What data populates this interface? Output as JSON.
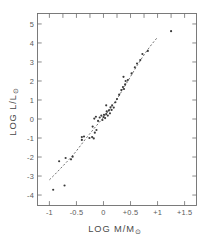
{
  "chart_data": {
    "type": "scatter",
    "title": "",
    "subtitle": "",
    "xlabel": "LOG  M/M",
    "xlabel_sub": "⊙",
    "ylabel": "LOG  L/L",
    "ylabel_sub": "⊙",
    "xlim": [
      -1.22,
      1.72
    ],
    "ylim": [
      -4.55,
      5.55
    ],
    "grid": false,
    "legend": null,
    "xticks": [
      -1,
      -0.5,
      0,
      0.5,
      1,
      1.5
    ],
    "xticklabels": [
      "-1",
      "-0.5",
      "0",
      "+0.5",
      "+1",
      "+1.5"
    ],
    "yticks": [
      -4,
      -3,
      -2,
      -1,
      0,
      1,
      2,
      3,
      4,
      5
    ],
    "yticklabels": [
      "-4",
      "-3",
      "-2",
      "-1",
      "0",
      "1",
      "2",
      "3",
      "4",
      "5"
    ],
    "xminor": [
      -1.25,
      -0.75,
      -0.25,
      0.25,
      0.75,
      1.25,
      1.75
    ],
    "frame": "box-all-sides-inward-ticks",
    "series": [
      {
        "name": "stars",
        "marker": "dot",
        "color": "#3a3a3a",
        "points": [
          [
            -0.93,
            -3.72
          ],
          [
            -0.72,
            -3.5
          ],
          [
            -0.82,
            -2.22
          ],
          [
            -0.7,
            -2.05
          ],
          [
            -0.6,
            -2.12
          ],
          [
            -0.57,
            -1.98
          ],
          [
            -0.4,
            -0.95
          ],
          [
            -0.4,
            -1.1
          ],
          [
            -0.36,
            -0.92
          ],
          [
            -0.26,
            -1.0
          ],
          [
            -0.21,
            -0.95
          ],
          [
            -0.18,
            -1.02
          ],
          [
            -0.16,
            -0.72
          ],
          [
            -0.13,
            -0.58
          ],
          [
            -0.2,
            -0.4
          ],
          [
            -0.17,
            0.02
          ],
          [
            -0.14,
            0.12
          ],
          [
            -0.1,
            -0.1
          ],
          [
            -0.07,
            0.08
          ],
          [
            -0.04,
            0.18
          ],
          [
            -0.02,
            -0.05
          ],
          [
            0.0,
            0.1
          ],
          [
            0.01,
            0.22
          ],
          [
            0.03,
            0.05
          ],
          [
            0.05,
            0.26
          ],
          [
            0.06,
            0.4
          ],
          [
            0.08,
            0.18
          ],
          [
            0.1,
            0.45
          ],
          [
            0.12,
            0.3
          ],
          [
            0.13,
            0.62
          ],
          [
            0.15,
            0.48
          ],
          [
            0.16,
            0.72
          ],
          [
            0.05,
            0.72
          ],
          [
            0.19,
            0.6
          ],
          [
            0.22,
            0.88
          ],
          [
            0.25,
            1.05
          ],
          [
            0.29,
            1.28
          ],
          [
            0.33,
            1.52
          ],
          [
            0.36,
            1.68
          ],
          [
            0.38,
            1.58
          ],
          [
            0.4,
            1.82
          ],
          [
            0.41,
            2.0
          ],
          [
            0.37,
            2.22
          ],
          [
            0.45,
            2.05
          ],
          [
            0.52,
            2.4
          ],
          [
            0.58,
            2.72
          ],
          [
            0.62,
            2.92
          ],
          [
            0.68,
            3.1
          ],
          [
            0.72,
            3.42
          ],
          [
            0.82,
            3.58
          ],
          [
            1.25,
            4.62
          ]
        ]
      }
    ],
    "fit_curve": {
      "name": "mass-luminosity relation",
      "style": "dashed",
      "color": "#6a6a6a",
      "points": [
        [
          -1.0,
          -3.2
        ],
        [
          -0.9,
          -2.92
        ],
        [
          -0.8,
          -2.62
        ],
        [
          -0.7,
          -2.32
        ],
        [
          -0.6,
          -2.02
        ],
        [
          -0.5,
          -1.68
        ],
        [
          -0.42,
          -1.38
        ],
        [
          -0.34,
          -1.08
        ],
        [
          -0.26,
          -0.8
        ],
        [
          -0.18,
          -0.52
        ],
        [
          -0.1,
          -0.25
        ],
        [
          -0.02,
          0.02
        ],
        [
          0.06,
          0.3
        ],
        [
          0.14,
          0.6
        ],
        [
          0.22,
          0.92
        ],
        [
          0.3,
          1.28
        ],
        [
          0.38,
          1.66
        ],
        [
          0.46,
          2.04
        ],
        [
          0.54,
          2.42
        ],
        [
          0.62,
          2.8
        ],
        [
          0.7,
          3.16
        ],
        [
          0.8,
          3.58
        ],
        [
          0.9,
          3.96
        ],
        [
          1.0,
          4.3
        ]
      ]
    }
  }
}
